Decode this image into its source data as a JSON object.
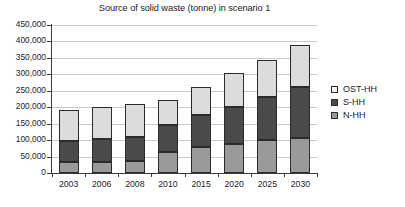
{
  "chart_data": {
    "type": "bar",
    "subtype": "stacked-column",
    "title": "Source of solid waste (tonne) in scenario 1",
    "xlabel": "",
    "ylabel": "",
    "categories": [
      "2003",
      "2006",
      "2008",
      "2010",
      "2015",
      "2020",
      "2025",
      "2030"
    ],
    "series": [
      {
        "name": "N-HH",
        "color": "#9a9a9a",
        "values": [
          33000,
          35000,
          36000,
          65000,
          80000,
          87000,
          99000,
          106000
        ]
      },
      {
        "name": "S-HH",
        "color": "#4a4a4a",
        "values": [
          64000,
          68000,
          75000,
          82000,
          95000,
          115000,
          132000,
          155000
        ]
      },
      {
        "name": "OST-HH",
        "color": "#dcdcdc",
        "values": [
          94000,
          97000,
          100000,
          75000,
          87000,
          101000,
          114000,
          128000
        ]
      }
    ],
    "stack_order_bottom_to_top": [
      "N-HH",
      "S-HH",
      "OST-HH"
    ],
    "totals": [
      191000,
      200000,
      211000,
      222000,
      262000,
      303000,
      345000,
      389000
    ],
    "ylim": [
      0,
      450000
    ],
    "ytick_step": 50000,
    "ytick_labels": [
      "450,000",
      "400,000",
      "350,000",
      "300,000",
      "250,000",
      "200,000",
      "150,000",
      "100,000",
      "50,000",
      "0"
    ],
    "ytick_values": [
      450000,
      400000,
      350000,
      300000,
      250000,
      200000,
      150000,
      100000,
      50000,
      0
    ],
    "grid": true,
    "legend_position": "right",
    "legend_entries": [
      "OST-HH",
      "S-HH",
      "N-HH"
    ]
  },
  "legend": {
    "items": [
      {
        "label": "OST-HH",
        "swatch": "legend-swatch-ost-hh"
      },
      {
        "label": "S-HH",
        "swatch": "legend-swatch-s-hh"
      },
      {
        "label": "N-HH",
        "swatch": "legend-swatch-n-hh"
      }
    ]
  },
  "colors": {
    "n_hh": "#9a9a9a",
    "s_hh": "#4a4a4a",
    "ost_hh": "#dcdcdc",
    "axis": "#3a3a3a",
    "grid": "#c9c9c9",
    "text": "#1c1c1c",
    "background": "#ffffff"
  }
}
